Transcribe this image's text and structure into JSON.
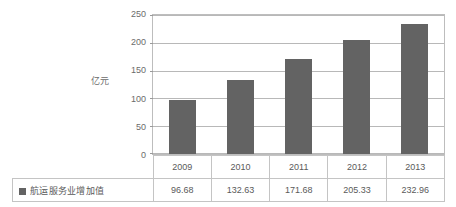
{
  "chart_data": {
    "type": "bar",
    "title": "",
    "subtitle": "",
    "xlabel": "",
    "ylabel": "亿元",
    "categories": [
      "2009",
      "2010",
      "2011",
      "2012",
      "2013"
    ],
    "series": [
      {
        "name": "航运服务业增加值",
        "values": [
          96.68,
          132.63,
          171.68,
          205.33,
          232.96
        ]
      }
    ],
    "values": [
      96.68,
      132.63,
      171.68,
      205.33,
      232.96
    ],
    "value_labels": [
      "96.68",
      "132.63",
      "171.68",
      "205.33",
      "232.96"
    ],
    "ylim": [
      0,
      250
    ],
    "ytick_labels": [
      "250",
      "200",
      "150",
      "100",
      "50",
      "0"
    ],
    "ytick_values": [
      250,
      200,
      150,
      100,
      50,
      0
    ],
    "ytick_step": 50,
    "grid": true,
    "grid_axis": "y",
    "legend_position": "table-row-left",
    "bar_color": "#636363",
    "grid_color": "#b8b8b8",
    "border_color": "#bdbdbd",
    "text_color": "#5a5a5a"
  },
  "table": {
    "legend_label": "航运服务业增加值",
    "year_row": [
      "2009",
      "2010",
      "2011",
      "2012",
      "2013"
    ],
    "value_row": [
      "96.68",
      "132.63",
      "171.68",
      "205.33",
      "232.96"
    ]
  },
  "axis": {
    "y_title": "亿元",
    "ticks": [
      "250",
      "200",
      "150",
      "100",
      "50",
      "0"
    ]
  }
}
